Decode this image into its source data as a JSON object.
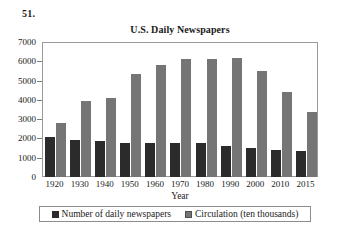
{
  "problem_number": "51.",
  "axis_title_x": "Year",
  "colors": {
    "series_0": "#2b2b2b",
    "series_1": "#757575",
    "frame": "#9a9a9a"
  },
  "chart_data": {
    "type": "bar",
    "title": "U.S. Daily Newspapers",
    "xlabel": "Year",
    "ylabel": "",
    "categories": [
      "1920",
      "1930",
      "1940",
      "1950",
      "1960",
      "1970",
      "1980",
      "1990",
      "2000",
      "2010",
      "2015"
    ],
    "series": [
      {
        "name": "Number of daily newspapers",
        "values": [
          2050,
          1940,
          1880,
          1770,
          1760,
          1750,
          1745,
          1610,
          1480,
          1390,
          1330
        ]
      },
      {
        "name": "Circulation (ten thousands)",
        "values": [
          2780,
          3930,
          4080,
          5350,
          5800,
          6120,
          6120,
          6150,
          5500,
          4400,
          3350
        ]
      }
    ],
    "ylim": [
      0,
      7000
    ],
    "yticks": [
      0,
      1000,
      2000,
      3000,
      4000,
      5000,
      6000,
      7000
    ],
    "ytick_labels": [
      "0",
      "1000",
      "2000",
      "3000",
      "4000",
      "5000",
      "6000",
      "7000"
    ],
    "grid": false,
    "legend_position": "bottom",
    "legend": [
      "Number of daily newspapers",
      "Circulation (ten thousands)"
    ]
  }
}
